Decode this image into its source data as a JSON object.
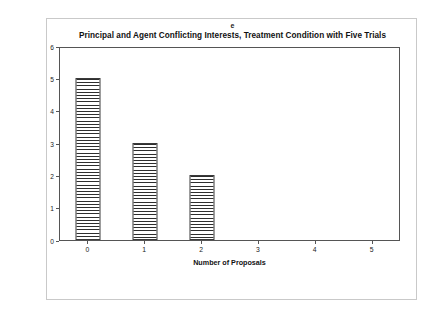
{
  "figure": {
    "panel_letter": "e"
  },
  "chart_data": {
    "type": "bar",
    "title": "Principal and Agent Conflicting Interests, Treatment Condition with Five Trials",
    "xlabel": "Number of Proposals",
    "ylabel": "Number of Agents",
    "categories": [
      "0",
      "1",
      "2",
      "3",
      "4",
      "5"
    ],
    "values": [
      5,
      3,
      2,
      0,
      0,
      0
    ],
    "ylim": [
      0,
      6
    ],
    "ytick_labels": [
      "0",
      "1",
      "2",
      "3",
      "4",
      "5",
      "6"
    ],
    "ytick_values": [
      0,
      1,
      2,
      3,
      4,
      5,
      6
    ],
    "grid": false,
    "legend": null,
    "bar_fill": "horizontal-line-hatch",
    "bar_edge_color": "#3a3a3a",
    "axis_color": "#555555"
  }
}
